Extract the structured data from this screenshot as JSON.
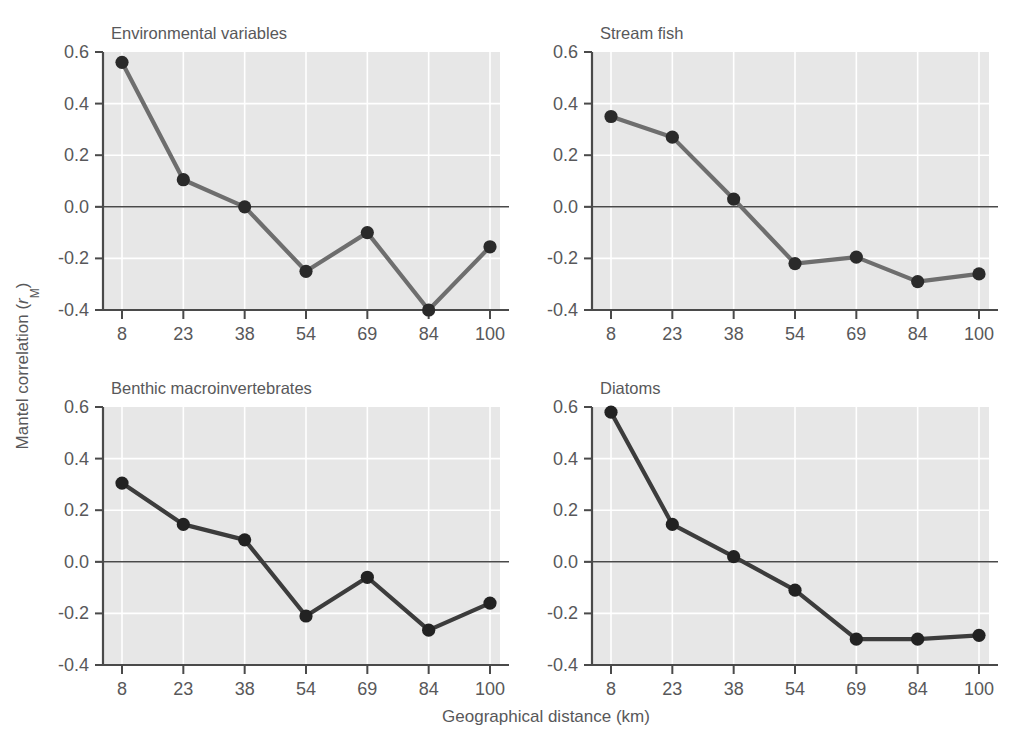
{
  "figure": {
    "background_color": "#ffffff",
    "plot_background_color": "#e7e7e7",
    "gridline_color": "#ffffff",
    "axis_color": "#4a4a4a",
    "text_color": "#58585a",
    "x_axis_title": "Geographical distance (km)",
    "y_axis_title_prefix": "Mantel correlation (",
    "y_axis_title_symbol": "r",
    "y_axis_title_subscript": "M",
    "y_axis_title_suffix": ")"
  },
  "chart_data": [
    {
      "type": "line",
      "title": "Environmental variables",
      "panel": "top-left",
      "xlabel": "Geographical distance (km)",
      "ylabel": "Mantel correlation (rM)",
      "categories": [
        "8",
        "23",
        "38",
        "54",
        "69",
        "84",
        "100"
      ],
      "x": [
        8,
        23,
        38,
        54,
        69,
        84,
        100
      ],
      "values": [
        0.56,
        0.105,
        0.0,
        -0.25,
        -0.1,
        -0.4,
        -0.155
      ],
      "xticks": [
        "8",
        "23",
        "38",
        "54",
        "69",
        "84",
        "100"
      ],
      "yticks": [
        "0.6",
        "0.4",
        "0.2",
        "0.0",
        "-0.2",
        "-0.4"
      ],
      "ytick_values": [
        0.6,
        0.4,
        0.2,
        0.0,
        -0.2,
        -0.4
      ],
      "ylim": [
        -0.4,
        0.6
      ],
      "grid": true,
      "line_color": "#6e6e6e",
      "marker_color": "#2a2a2a",
      "legend": null
    },
    {
      "type": "line",
      "title": "Stream fish",
      "panel": "top-right",
      "xlabel": "Geographical distance (km)",
      "ylabel": "Mantel correlation (rM)",
      "categories": [
        "8",
        "23",
        "38",
        "54",
        "69",
        "84",
        "100"
      ],
      "x": [
        8,
        23,
        38,
        54,
        69,
        84,
        100
      ],
      "values": [
        0.35,
        0.27,
        0.03,
        -0.22,
        -0.195,
        -0.29,
        -0.26
      ],
      "xticks": [
        "8",
        "23",
        "38",
        "54",
        "69",
        "84",
        "100"
      ],
      "yticks": [
        "0.6",
        "0.4",
        "0.2",
        "0.0",
        "-0.2",
        "-0.4"
      ],
      "ytick_values": [
        0.6,
        0.4,
        0.2,
        0.0,
        -0.2,
        -0.4
      ],
      "ylim": [
        -0.4,
        0.6
      ],
      "grid": true,
      "line_color": "#6e6e6e",
      "marker_color": "#2a2a2a",
      "legend": null
    },
    {
      "type": "line",
      "title": "Benthic macroinvertebrates",
      "panel": "bottom-left",
      "xlabel": "Geographical distance (km)",
      "ylabel": "Mantel correlation (rM)",
      "categories": [
        "8",
        "23",
        "38",
        "54",
        "69",
        "84",
        "100"
      ],
      "x": [
        8,
        23,
        38,
        54,
        69,
        84,
        100
      ],
      "values": [
        0.305,
        0.145,
        0.085,
        -0.21,
        -0.06,
        -0.265,
        -0.16
      ],
      "xticks": [
        "8",
        "23",
        "38",
        "54",
        "69",
        "84",
        "100"
      ],
      "yticks": [
        "0.6",
        "0.4",
        "0.2",
        "0.0",
        "-0.2",
        "-0.4"
      ],
      "ytick_values": [
        0.6,
        0.4,
        0.2,
        0.0,
        -0.2,
        -0.4
      ],
      "ylim": [
        -0.4,
        0.6
      ],
      "grid": true,
      "line_color": "#3c3c3c",
      "marker_color": "#222222",
      "legend": null
    },
    {
      "type": "line",
      "title": "Diatoms",
      "panel": "bottom-right",
      "xlabel": "Geographical distance (km)",
      "ylabel": "Mantel correlation (rM)",
      "categories": [
        "8",
        "23",
        "38",
        "54",
        "69",
        "84",
        "100"
      ],
      "x": [
        8,
        23,
        38,
        54,
        69,
        84,
        100
      ],
      "values": [
        0.58,
        0.145,
        0.02,
        -0.11,
        -0.3,
        -0.3,
        -0.285
      ],
      "xticks": [
        "8",
        "23",
        "38",
        "54",
        "69",
        "84",
        "100"
      ],
      "yticks": [
        "0.6",
        "0.4",
        "0.2",
        "0.0",
        "-0.2",
        "-0.4"
      ],
      "ytick_values": [
        0.6,
        0.4,
        0.2,
        0.0,
        -0.2,
        -0.4
      ],
      "ylim": [
        -0.4,
        0.6
      ],
      "grid": true,
      "line_color": "#3c3c3c",
      "marker_color": "#222222",
      "legend": null
    }
  ],
  "layout": {
    "panels": [
      {
        "x": 103,
        "y": 52,
        "width": 397,
        "height": 258
      },
      {
        "x": 592,
        "y": 52,
        "width": 397,
        "height": 258
      },
      {
        "x": 103,
        "y": 407,
        "width": 397,
        "height": 258
      },
      {
        "x": 592,
        "y": 407,
        "width": 397,
        "height": 258
      }
    ]
  }
}
